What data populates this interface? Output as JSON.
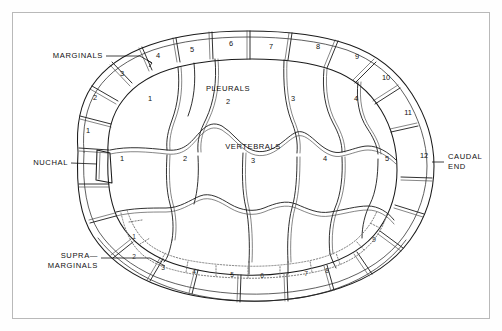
{
  "frame": {
    "border_color": "#b9b9b9",
    "background_color": "#ffffff"
  },
  "colors": {
    "outline": "#1a1a1a",
    "seam": "#2a2a2a",
    "dotted_supramarginal": "#777777",
    "text": "#111111"
  },
  "region_labels": [
    {
      "id": "marginals",
      "text": "MARGINALS",
      "x": 103,
      "y": 56,
      "anchor": "end"
    },
    {
      "id": "pleurals",
      "text": "PLEURALS",
      "x": 228,
      "y": 89,
      "anchor": "middle"
    },
    {
      "id": "vertebrals",
      "text": "VERTEBRALS",
      "x": 253,
      "y": 147,
      "anchor": "middle"
    },
    {
      "id": "nuchal",
      "text": "NUCHAL",
      "x": 68,
      "y": 163,
      "anchor": "end"
    },
    {
      "id": "supra-line-1",
      "text": "SUPRA—",
      "x": 98,
      "y": 256,
      "anchor": "end"
    },
    {
      "id": "supra-line-2",
      "text": "MARGINALS",
      "x": 98,
      "y": 266,
      "anchor": "end"
    },
    {
      "id": "caudal-line-1",
      "text": "CAUDAL",
      "x": 448,
      "y": 157,
      "anchor": "start"
    },
    {
      "id": "caudal-line-2",
      "text": "END",
      "x": 448,
      "y": 167,
      "anchor": "start"
    }
  ],
  "leaders": [
    {
      "id": "marginals-leader",
      "points": "106,56 140,56 151,62"
    },
    {
      "id": "nuchal-leader",
      "points": "71,163 97,163"
    },
    {
      "id": "supramarginals-leader",
      "points": "101,258 150,258 163,264"
    }
  ],
  "marginals": {
    "name": "marginals",
    "count": 12,
    "scutes": [
      {
        "number": "1",
        "x": 88,
        "y": 131
      },
      {
        "number": "2",
        "x": 95,
        "y": 98
      },
      {
        "number": "3",
        "x": 122,
        "y": 74
      },
      {
        "number": "4",
        "x": 158,
        "y": 56
      },
      {
        "number": "5",
        "x": 192,
        "y": 50
      },
      {
        "number": "6",
        "x": 231,
        "y": 44
      },
      {
        "number": "7",
        "x": 271,
        "y": 47
      },
      {
        "number": "8",
        "x": 318,
        "y": 47
      },
      {
        "number": "9",
        "x": 357,
        "y": 57
      },
      {
        "number": "10",
        "x": 386,
        "y": 78
      },
      {
        "number": "11",
        "x": 408,
        "y": 113
      },
      {
        "number": "12",
        "x": 424,
        "y": 156
      }
    ]
  },
  "pleurals": {
    "name": "pleurals",
    "count": 4,
    "scutes": [
      {
        "number": "1",
        "x": 150,
        "y": 99
      },
      {
        "number": "2",
        "x": 228,
        "y": 102
      },
      {
        "number": "3",
        "x": 293,
        "y": 99
      },
      {
        "number": "4",
        "x": 356,
        "y": 99
      }
    ]
  },
  "vertebrals": {
    "name": "vertebrals",
    "count": 5,
    "scutes": [
      {
        "number": "1",
        "x": 122,
        "y": 159
      },
      {
        "number": "2",
        "x": 185,
        "y": 159
      },
      {
        "number": "3",
        "x": 253,
        "y": 161
      },
      {
        "number": "4",
        "x": 325,
        "y": 159
      },
      {
        "number": "5",
        "x": 387,
        "y": 159
      }
    ]
  },
  "supramarginals": {
    "name": "supramarginals",
    "count": 9,
    "style": "dotted",
    "scutes": [
      {
        "number": "1",
        "x": 134,
        "y": 237
      },
      {
        "number": "2",
        "x": 134,
        "y": 257
      },
      {
        "number": "3",
        "x": 163,
        "y": 268
      },
      {
        "number": "4",
        "x": 194,
        "y": 272
      },
      {
        "number": "5",
        "x": 232,
        "y": 275
      },
      {
        "number": "6",
        "x": 262,
        "y": 276
      },
      {
        "number": "7",
        "x": 306,
        "y": 274
      },
      {
        "number": "8",
        "x": 327,
        "y": 271
      },
      {
        "number": "9",
        "x": 374,
        "y": 240
      }
    ]
  },
  "lower_marginals": {
    "name": "lower-marginals-unlabeled",
    "note": "lower rim marginal plates drawn without numbers"
  }
}
